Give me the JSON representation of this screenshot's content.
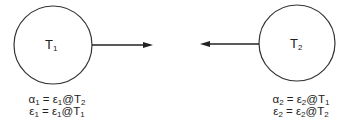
{
  "nodes": [
    {
      "id": "T1",
      "label": "T",
      "sub": "1",
      "equations": [
        {
          "lhs": "α",
          "lhs_sub": "1",
          "rhs": "ε",
          "rhs_sub": "1",
          "at": "T",
          "at_sub": "2"
        },
        {
          "lhs": "ε",
          "lhs_sub": "1",
          "rhs": "ε",
          "rhs_sub": "1",
          "at": "T",
          "at_sub": "1"
        }
      ]
    },
    {
      "id": "T2",
      "label": "T",
      "sub": "2",
      "equations": [
        {
          "lhs": "α",
          "lhs_sub": "2",
          "rhs": "ε",
          "rhs_sub": "2",
          "at": "T",
          "at_sub": "1"
        },
        {
          "lhs": "ε",
          "lhs_sub": "2",
          "rhs": "ε",
          "rhs_sub": "2",
          "at": "T",
          "at_sub": "2"
        }
      ]
    }
  ],
  "symbols": {
    "equals": " = ",
    "at": "@"
  },
  "edges": [
    {
      "from": "T1",
      "direction": "right"
    },
    {
      "from": "T2",
      "direction": "left"
    }
  ]
}
